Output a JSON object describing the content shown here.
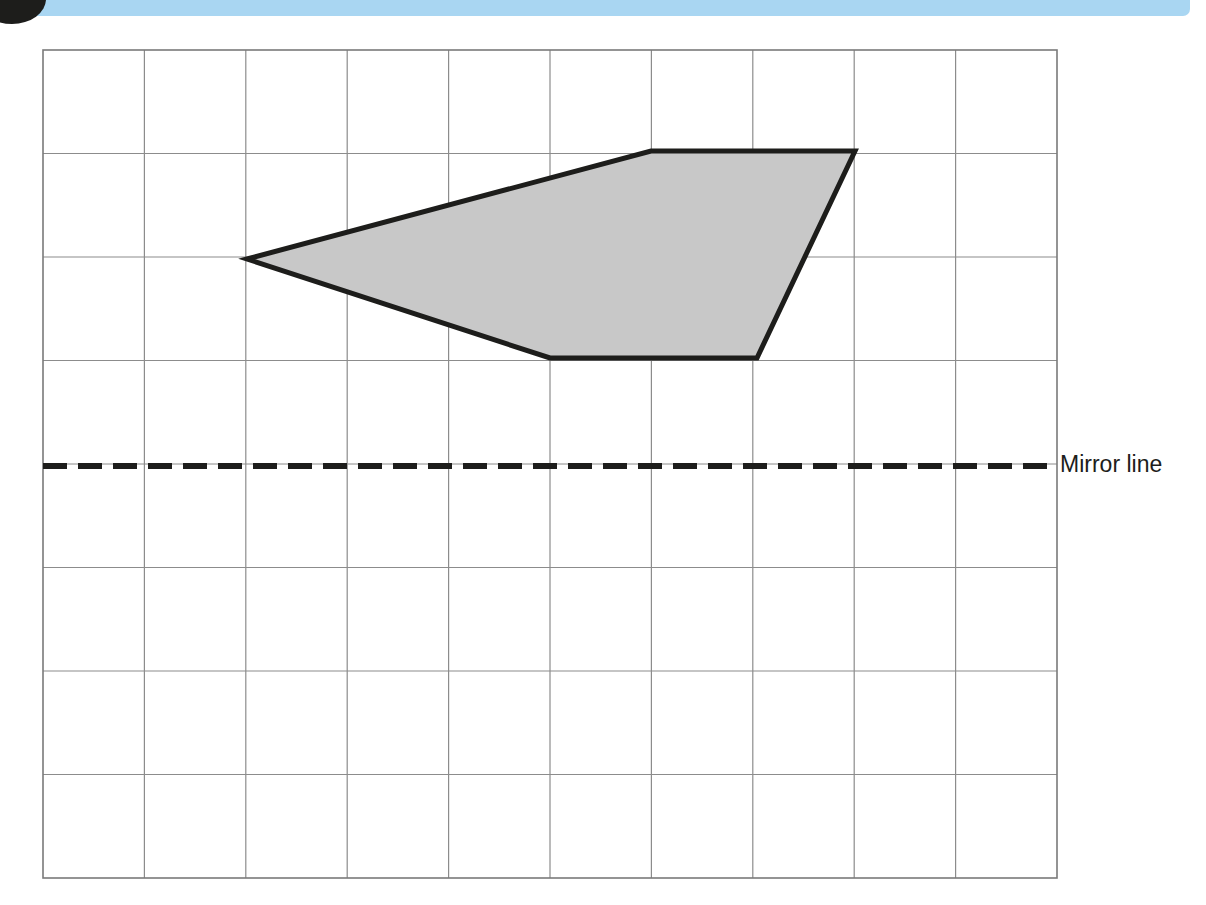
{
  "header": {
    "badge_label": "",
    "bar_color": "#a9d6f2",
    "badge_color": "#1d1d1b"
  },
  "figure": {
    "type": "reflection-worksheet",
    "grid": {
      "x0": 43,
      "y0": 50,
      "x1": 1057,
      "y1": 878,
      "columns": 10,
      "rows": 8,
      "cell_width": 101.4,
      "cell_height": 103.5,
      "line_color": "#8c8c8c",
      "border_color": "#7a7a7a"
    },
    "shape": {
      "name": "pentagon",
      "fill": "#c8c8c8",
      "stroke": "#1d1d1b",
      "stroke_width": 5,
      "vertices": [
        [
          247,
          259
        ],
        [
          651,
          151
        ],
        [
          855,
          151
        ],
        [
          757,
          358
        ],
        [
          550,
          358
        ]
      ],
      "vertices_grid": [
        [
          2,
          2
        ],
        [
          6,
          1
        ],
        [
          8,
          1
        ],
        [
          7,
          3
        ],
        [
          5,
          3
        ]
      ]
    },
    "mirror_line": {
      "label": "Mirror line",
      "y": 466,
      "x_start": 43,
      "x_end": 1052,
      "color": "#1d1d1b",
      "dash": "24 11",
      "width": 6
    }
  }
}
